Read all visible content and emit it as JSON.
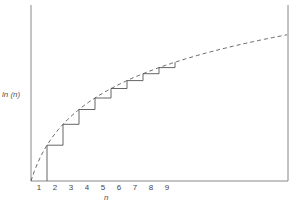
{
  "chart_data": {
    "type": "line",
    "title": "",
    "xlabel": "n",
    "ylabel": "ln (n)",
    "categories": [
      "1",
      "2",
      "3",
      "4",
      "5",
      "6",
      "7",
      "8",
      "9"
    ],
    "series": [
      {
        "name": "ln(n) curve",
        "style": "dashed",
        "x": [
          1,
          2,
          3,
          4,
          5,
          6,
          7,
          8,
          9,
          10,
          12,
          14,
          17
        ],
        "values": [
          0,
          0.693,
          1.099,
          1.386,
          1.609,
          1.792,
          1.946,
          2.079,
          2.197,
          2.303,
          2.485,
          2.639,
          2.833
        ]
      },
      {
        "name": "staircase",
        "style": "solid",
        "x": [
          2,
          3,
          4,
          5,
          6,
          7,
          8,
          9,
          10
        ],
        "values": [
          0.693,
          1.099,
          1.386,
          1.609,
          1.792,
          1.946,
          2.079,
          2.197,
          2.303
        ]
      }
    ],
    "xlim": [
      1,
      17
    ],
    "ylim": [
      0,
      2.9
    ],
    "grid": false,
    "legend": "none"
  },
  "axes": {
    "x_title": "n",
    "y_title": "ln (n)",
    "x_ticks": [
      "1",
      "2",
      "3",
      "4",
      "5",
      "6",
      "7",
      "8",
      "9"
    ]
  },
  "colors": {
    "line": "#555555",
    "axis": "#888888"
  }
}
